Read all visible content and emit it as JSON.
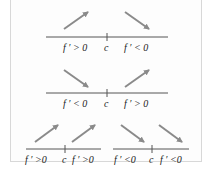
{
  "colors": {
    "arrow": "#8a8a8a",
    "axis": "#555555",
    "text": "#222222",
    "border": "#d8d8d8"
  },
  "diagrams": [
    {
      "name": "local-maximum",
      "left_label": "f ′ > 0",
      "center_label": "c",
      "right_label": "f ′ < 0",
      "left_arrow": "up",
      "right_arrow": "down"
    },
    {
      "name": "local-minimum",
      "left_label": "f ′ < 0",
      "center_label": "c",
      "right_label": "f ′ > 0",
      "left_arrow": "down",
      "right_arrow": "up"
    },
    {
      "name": "increasing-no-extremum",
      "left_label": "f ′ >0",
      "center_label": "c",
      "right_label": "f ′ >0",
      "left_arrow": "up",
      "right_arrow": "up"
    },
    {
      "name": "decreasing-no-extremum",
      "left_label": "f ′ <0",
      "center_label": "c",
      "right_label": "f ′ <0",
      "left_arrow": "down",
      "right_arrow": "down"
    }
  ]
}
